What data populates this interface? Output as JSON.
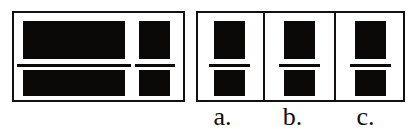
{
  "figure": {
    "kind": "multiple-choice-visual-matching",
    "background_color": "#ffffff",
    "ink_color": "#0b0908",
    "border_color": "#14100f"
  },
  "stimulus": {
    "name": "stimulus-panel",
    "description": "Framed panel containing four solid black rectangles arranged in two columns and two rows, separated by thin horizontal rules.",
    "shapes": [
      {
        "id": "wide-top",
        "label": "wide top rectangle"
      },
      {
        "id": "wide-bottom",
        "label": "wide bottom rectangle"
      },
      {
        "id": "narrow-top",
        "label": "narrow top rectangle"
      },
      {
        "id": "narrow-bottom",
        "label": "narrow bottom rectangle"
      }
    ],
    "rules": [
      {
        "id": "wide-rule",
        "label": "horizontal rule under wide top rectangle"
      },
      {
        "id": "narrow-rule",
        "label": "horizontal rule under narrow top rectangle"
      }
    ]
  },
  "options": {
    "name": "options-group",
    "items": [
      {
        "key": "a",
        "label": "a.",
        "shapes": [
          {
            "id": "top",
            "label": "top black square"
          },
          {
            "id": "bottom",
            "label": "bottom black square"
          }
        ],
        "rule": {
          "id": "rule",
          "label": "horizontal rule between squares"
        }
      },
      {
        "key": "b",
        "label": "b.",
        "shapes": [
          {
            "id": "top",
            "label": "top black square"
          },
          {
            "id": "bottom",
            "label": "bottom black square"
          }
        ],
        "rule": {
          "id": "rule",
          "label": "horizontal rule between squares"
        }
      },
      {
        "key": "c",
        "label": "c.",
        "shapes": [
          {
            "id": "top",
            "label": "top black square"
          },
          {
            "id": "bottom",
            "label": "bottom black square"
          }
        ],
        "rule": {
          "id": "rule",
          "label": "horizontal rule between squares"
        }
      }
    ]
  }
}
